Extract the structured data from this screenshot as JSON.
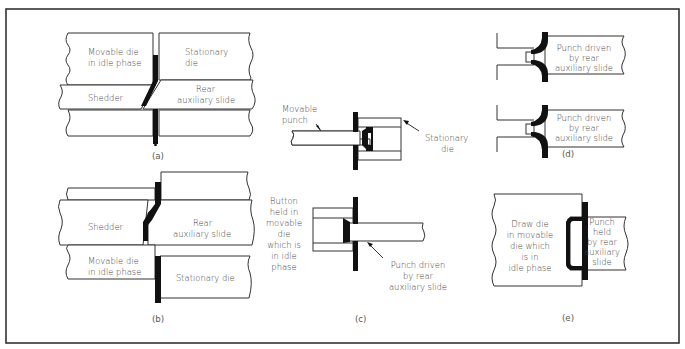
{
  "figure": {
    "panels": {
      "a": {
        "caption": "(a)",
        "labels": {
          "movable_die": [
            "Movable die",
            "in idle phase"
          ],
          "stationary_die": [
            "Stationary",
            "die"
          ],
          "shedder": "Shedder",
          "rear_slide": [
            "Rear",
            "auxiliary slide"
          ]
        }
      },
      "b": {
        "caption": "(b)",
        "labels": {
          "shedder": "Shedder",
          "rear_slide": [
            "Rear",
            "auxiliary slide"
          ],
          "movable_die": [
            "Movable die",
            "in idle phase"
          ],
          "stationary_die": "Stationary die"
        }
      },
      "c": {
        "caption": "(c)",
        "labels": {
          "movable_punch": [
            "Movable",
            "punch"
          ],
          "stationary_die": [
            "Stationary",
            "die"
          ],
          "button": [
            "Button",
            "held in",
            "movable",
            "die",
            "which is",
            "in idle",
            "phase"
          ],
          "punch_driven": [
            "Punch driven",
            "by rear",
            "auxiliary slide"
          ]
        }
      },
      "d": {
        "caption": "(d)",
        "labels": {
          "punch_top": [
            "Punch driven",
            "by rear",
            "auxiliary slide"
          ],
          "punch_bottom": [
            "Punch driven",
            "by rear",
            "auxiliary slide"
          ]
        }
      },
      "e": {
        "caption": "(e)",
        "labels": {
          "draw_die": [
            "Draw die",
            "in movable",
            "die which",
            "is in",
            "idle phase"
          ],
          "punch": [
            "Punch",
            "held",
            "by rear",
            "auxiliary",
            "slide"
          ]
        }
      }
    }
  }
}
